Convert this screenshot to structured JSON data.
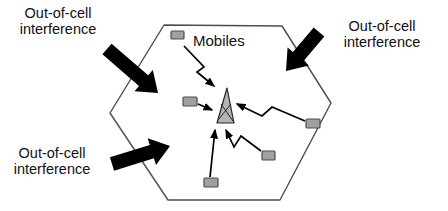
{
  "labels": {
    "interference_top_left": "Out-of-cell\ninterference",
    "interference_top_right": "Out-of-cell\ninterference",
    "interference_bottom_left": "Out-of-cell\ninterference",
    "mobiles": "Mobiles"
  },
  "colors": {
    "background": "#ffffff",
    "cell_stroke": "#4d4d4d",
    "mobile_fill": "#a0a0a0",
    "mobile_stroke": "#4d4d4d",
    "antenna_fill": "#b4b4b4",
    "antenna_stroke": "#222222",
    "signal_stroke": "#000000",
    "interference_fill": "#000000"
  },
  "diagram": {
    "hexagon": "164,25 282,26 331,103 280,200 168,200 110,113",
    "antenna": {
      "body": "227,88 217,123 234,123",
      "struts": [
        "218,120 231,104",
        "233,121 221,104"
      ]
    },
    "mobiles": [
      {
        "x": 171,
        "y": 31,
        "w": 13,
        "h": 8
      },
      {
        "x": 183,
        "y": 97,
        "w": 14,
        "h": 9
      },
      {
        "x": 204,
        "y": 178,
        "w": 14,
        "h": 9
      },
      {
        "x": 262,
        "y": 151,
        "w": 13,
        "h": 9
      },
      {
        "x": 306,
        "y": 119,
        "w": 14,
        "h": 9
      }
    ],
    "signal_arrows": [
      {
        "points": "184,46 204,67 197,72 214,86"
      },
      {
        "points": "198,104 212,110"
      },
      {
        "points": "210,177 215,130"
      },
      {
        "points": "261,151 241,136 234,147 226,130"
      },
      {
        "points": "305,121 272,107 262,116 237,104"
      }
    ],
    "block_arrows": [
      {
        "tail": [
          107,
          49
        ],
        "tip": [
          158,
          93
        ]
      },
      {
        "tail": [
          319,
          32
        ],
        "tip": [
          286,
          71
        ]
      },
      {
        "tail": [
          112,
          164
        ],
        "tip": [
          170,
          146
        ]
      }
    ]
  }
}
